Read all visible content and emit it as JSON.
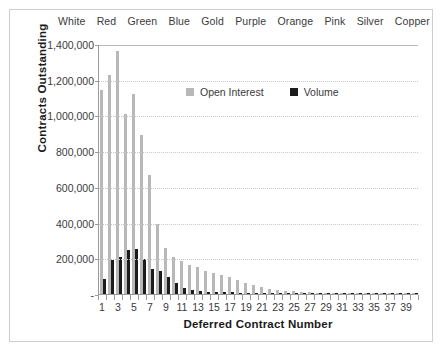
{
  "chart_data": {
    "type": "bar",
    "title": "",
    "xlabel": "Deferred Contract Number",
    "ylabel": "Contracts Outstanding",
    "ylim": [
      0,
      1400000
    ],
    "ytick_values": [
      0,
      200000,
      400000,
      600000,
      800000,
      1000000,
      1200000,
      1400000
    ],
    "ytick_labels": [
      "-",
      "200,000",
      "400,000",
      "600,000",
      "800,000",
      "1,000,000",
      "1,200,000",
      "1,400,000"
    ],
    "grid": true,
    "grid_axis": "y",
    "legend_position": "upper center",
    "x": [
      1,
      2,
      3,
      4,
      5,
      6,
      7,
      8,
      9,
      10,
      11,
      12,
      13,
      14,
      15,
      16,
      17,
      18,
      19,
      20,
      21,
      22,
      23,
      24,
      25,
      26,
      27,
      28,
      29,
      30,
      31,
      32,
      33,
      34,
      35,
      36,
      37,
      38,
      39,
      40
    ],
    "xtick_labels": [
      "1",
      "3",
      "5",
      "7",
      "9",
      "11",
      "13",
      "15",
      "17",
      "19",
      "21",
      "23",
      "25",
      "27",
      "29",
      "31",
      "33",
      "35",
      "37",
      "39"
    ],
    "series": [
      {
        "name": "Open Interest",
        "color": "#b8b8b8",
        "values": [
          1140000,
          1225000,
          1360000,
          1010000,
          1120000,
          890000,
          665000,
          390000,
          255000,
          205000,
          185000,
          165000,
          150000,
          130000,
          118000,
          105000,
          95000,
          80000,
          62000,
          48000,
          38000,
          30000,
          24000,
          19000,
          15000,
          12000,
          9000,
          7000,
          5500,
          4500,
          3500,
          3000,
          2500,
          2000,
          1800,
          1500,
          1200,
          1000,
          800,
          600
        ]
      },
      {
        "name": "Volume",
        "color": "#1c1c1c",
        "values": [
          85000,
          190000,
          210000,
          245000,
          250000,
          195000,
          140000,
          130000,
          95000,
          60000,
          35000,
          22000,
          17000,
          14000,
          12000,
          10000,
          9000,
          8000,
          7000,
          6000,
          5000,
          4000,
          3500,
          3000,
          2500,
          2000,
          1800,
          1500,
          1200,
          1000,
          900,
          800,
          700,
          600,
          500,
          450,
          400,
          350,
          300,
          250
        ]
      }
    ],
    "secondary_axis": {
      "position": "top",
      "label": "",
      "tick_labels": [
        "White",
        "Red",
        "Green",
        "Blue",
        "Gold",
        "Purple",
        "Orange",
        "Pink",
        "Silver",
        "Copper"
      ]
    }
  }
}
